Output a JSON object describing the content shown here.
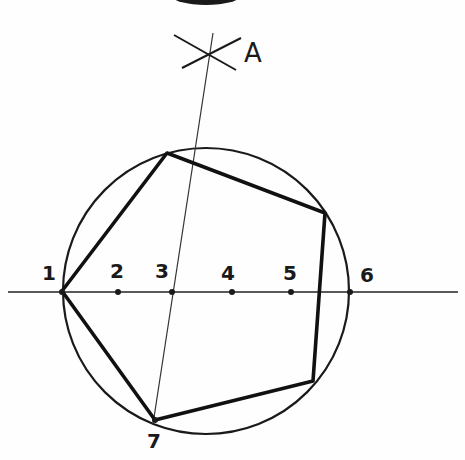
{
  "diagram": {
    "colors": {
      "ink": "#1a1a1a",
      "background": "#fefefe"
    },
    "circle": {
      "cx": 206,
      "cy": 291,
      "r": 143
    },
    "baseline": {
      "x1": 8,
      "y1": 292,
      "x2": 458,
      "y2": 292
    },
    "construction_line": {
      "x1": 213,
      "y1": 33,
      "x2": 153,
      "y2": 424
    },
    "arc_marks": [
      {
        "x1": 174,
        "y1": 35,
        "x2": 236,
        "y2": 70
      },
      {
        "x1": 182,
        "y1": 68,
        "x2": 241,
        "y2": 38
      }
    ],
    "pentagon_vertices": [
      {
        "x": 62,
        "y": 291
      },
      {
        "x": 167,
        "y": 153
      },
      {
        "x": 325,
        "y": 213
      },
      {
        "x": 313,
        "y": 381
      },
      {
        "x": 155,
        "y": 420
      }
    ],
    "points": [
      {
        "id": "1",
        "x": 62,
        "y": 292,
        "label": "1",
        "lx": 42,
        "ly": 280
      },
      {
        "id": "2",
        "x": 118,
        "y": 292,
        "label": "2",
        "lx": 110,
        "ly": 278
      },
      {
        "id": "3",
        "x": 172,
        "y": 292,
        "label": "3",
        "lx": 155,
        "ly": 278
      },
      {
        "id": "4",
        "x": 232,
        "y": 292,
        "label": "4",
        "lx": 221,
        "ly": 280
      },
      {
        "id": "5",
        "x": 291,
        "y": 292,
        "label": "5",
        "lx": 283,
        "ly": 280
      },
      {
        "id": "6",
        "x": 350,
        "y": 292,
        "label": "6",
        "lx": 360,
        "ly": 282
      },
      {
        "id": "7",
        "x": 155,
        "y": 420,
        "label": "7",
        "lx": 147,
        "ly": 448
      }
    ],
    "label_a": {
      "text": "A",
      "x": 244,
      "y": 62
    }
  }
}
